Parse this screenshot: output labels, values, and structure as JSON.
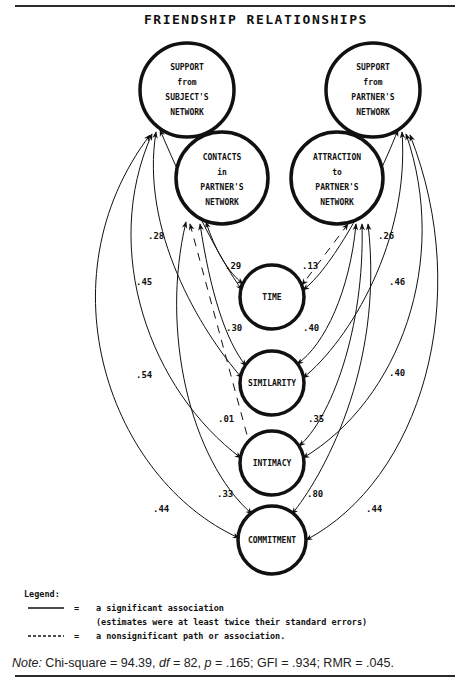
{
  "title": "FRIENDSHIP RELATIONSHIPS",
  "nodes": {
    "support_subject": {
      "lines": [
        "SUPPORT",
        "from",
        "SUBJECT'S",
        "NETWORK"
      ],
      "cx": 187,
      "cy": 90,
      "r": 47
    },
    "support_partner": {
      "lines": [
        "SUPPORT",
        "from",
        "PARTNER'S",
        "NETWORK"
      ],
      "cx": 373,
      "cy": 90,
      "r": 47
    },
    "contacts_partner": {
      "lines": [
        "CONTACTS",
        "in",
        "PARTNER'S",
        "NETWORK"
      ],
      "cx": 222,
      "cy": 178,
      "r": 46
    },
    "attraction_partner": {
      "lines": [
        "ATTRACTION",
        "to",
        "PARTNER'S",
        "NETWORK"
      ],
      "cx": 337,
      "cy": 178,
      "r": 46
    },
    "time": {
      "lines": [
        "TIME"
      ],
      "cx": 272,
      "cy": 297,
      "r": 32
    },
    "similarity": {
      "lines": [
        "SIMILARITY"
      ],
      "cx": 272,
      "cy": 383,
      "r": 32
    },
    "intimacy": {
      "lines": [
        "INTIMACY"
      ],
      "cx": 272,
      "cy": 463,
      "r": 32
    },
    "commitment": {
      "lines": [
        "COMMITMENT"
      ],
      "cx": 272,
      "cy": 540,
      "r": 34
    }
  },
  "coefficients": {
    "contacts_time": ".29",
    "contacts_similarity": ".30",
    "contacts_intimacy": ".01",
    "contacts_commitment": ".33",
    "attraction_time": ".13",
    "attraction_similarity": ".40",
    "attraction_intimacy": ".35",
    "attraction_commitment": ".80",
    "subject_time": ".28",
    "subject_similarity": ".45",
    "subject_intimacy": ".54",
    "subject_commitment": ".44",
    "partner_time": ".26",
    "partner_similarity": ".46",
    "partner_intimacy": ".40",
    "partner_commitment": ".44"
  },
  "legend": {
    "heading": "Legend:",
    "solid_eq": "=",
    "solid_label": "a significant association",
    "solid_sub": "(estimates were at least twice their standard errors)",
    "dashed_eq": "=",
    "dashed_label": "a nonsignificant path or association."
  },
  "note": {
    "prefix": "Note:",
    "text1": " Chi-square = 94.39, ",
    "df_label": "df",
    "text2": " = 82, ",
    "p_label": "p",
    "text3": " = .165; GFI = .934; RMR = .045."
  },
  "colors": {
    "ink": "#111111",
    "paper": "#ffffff",
    "rule": "#2a2a2a"
  }
}
